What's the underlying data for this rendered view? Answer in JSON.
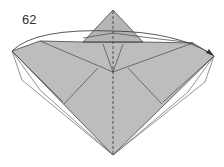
{
  "diagram": {
    "step_number": "62",
    "colors": {
      "paper_color": "#b9b9b9",
      "paper_light": "#c6c6c6",
      "line_color": "#555555",
      "background": "#ffffff"
    },
    "elements": [
      "step-label",
      "valley-fold-line-vertical-dashed",
      "top-triangle-flap",
      "left-wing-flap",
      "right-wing-flap",
      "back-layer-outline",
      "curved-fold-arrow"
    ]
  }
}
